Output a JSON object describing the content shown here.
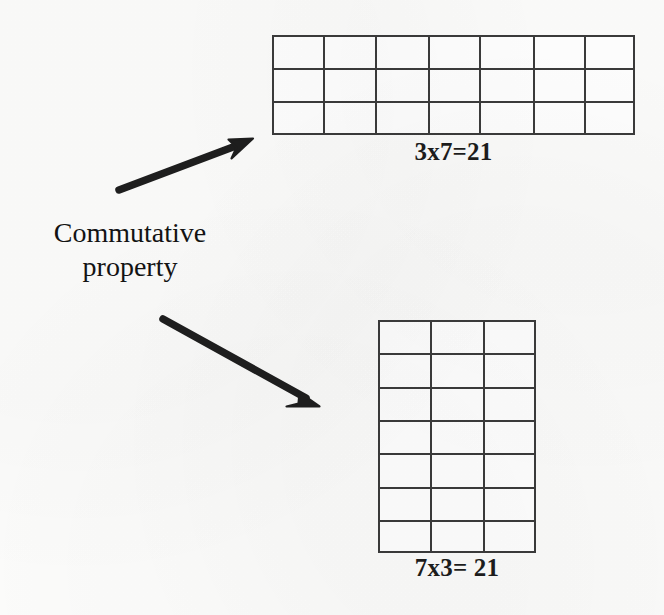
{
  "page": {
    "background_color": "#fcfcfb",
    "ink_color": "#3b3b3b",
    "width": 664,
    "height": 615
  },
  "concept": {
    "line1": "Commutative",
    "line2": "property"
  },
  "arrows": [
    {
      "name": "arrow-to-top-array",
      "direction": "up-right",
      "from": [
        118,
        191
      ],
      "to": [
        253,
        139
      ]
    },
    {
      "name": "arrow-to-bottom-array",
      "direction": "down-right",
      "from": [
        162,
        318
      ],
      "to": [
        319,
        407
      ]
    }
  ],
  "arrays": [
    {
      "id": "grid-3x7",
      "rows": 3,
      "cols": 7,
      "total_cells": 21,
      "label": "3x7=21",
      "factor_a": 3,
      "factor_b": 7,
      "product": 21
    },
    {
      "id": "grid-7x3",
      "rows": 7,
      "cols": 3,
      "total_cells": 21,
      "label": "7x3= 21",
      "factor_a": 7,
      "factor_b": 3,
      "product": 21
    }
  ]
}
